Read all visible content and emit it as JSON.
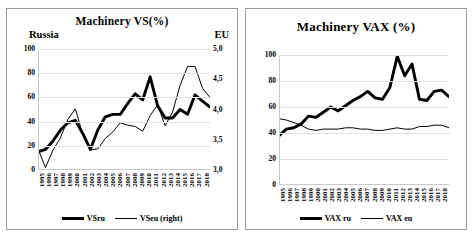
{
  "figure": {
    "panels": [
      {
        "id": "machinery-vs",
        "title": "Machinery VS(%)",
        "left_corner_label": "Russia",
        "right_corner_label": "EU"
      },
      {
        "id": "machinery-vax",
        "title": "Machinery VAX (%)"
      }
    ]
  },
  "chart_data": [
    {
      "type": "line",
      "id": "machinery-vs",
      "title": "Machinery VS(%)",
      "xlabel": "",
      "ylabel": "Russia",
      "y2label": "EU",
      "ylim": [
        0,
        100
      ],
      "yticks": [
        "0",
        "20",
        "40",
        "60",
        "80",
        "100"
      ],
      "ytick_values": [
        0,
        20,
        40,
        60,
        80,
        100
      ],
      "y2lim": [
        3.0,
        5.0
      ],
      "y2ticks": [
        "3,0",
        "3,5",
        "4,0",
        "4,5",
        "5,0"
      ],
      "y2tick_values": [
        3.0,
        3.5,
        4.0,
        4.5,
        5.0
      ],
      "grid": true,
      "legend_position": "bottom",
      "x": [
        "1995",
        "1996",
        "1997",
        "1998",
        "1999",
        "2000",
        "2001",
        "2002",
        "2003",
        "2004",
        "2005",
        "2006",
        "2007",
        "2008",
        "2009",
        "2010",
        "2011",
        "2012",
        "2013",
        "2014",
        "2015",
        "2016",
        "2017",
        "2018"
      ],
      "series": [
        {
          "name": "VSru",
          "axis": "left",
          "style": "bold",
          "values": [
            15,
            17,
            24,
            33,
            39,
            41,
            30,
            17,
            33,
            44,
            46,
            46,
            55,
            63,
            58,
            77,
            53,
            43,
            43,
            50,
            46,
            62,
            57,
            52
          ]
        },
        {
          "name": "VSeu (right)",
          "axis": "right",
          "style": "thin",
          "values": [
            3.35,
            3.04,
            3.33,
            3.53,
            3.84,
            4.01,
            3.58,
            3.33,
            3.35,
            3.52,
            3.63,
            3.78,
            3.74,
            3.72,
            3.64,
            3.9,
            4.08,
            3.73,
            3.96,
            4.4,
            4.71,
            4.71,
            4.35,
            4.2
          ]
        }
      ]
    },
    {
      "type": "line",
      "id": "machinery-vax",
      "title": "Machinery VAX (%)",
      "xlabel": "",
      "ylabel": "",
      "ylim": [
        0,
        100
      ],
      "yticks": [
        "0",
        "20",
        "40",
        "60",
        "80",
        "100"
      ],
      "ytick_values": [
        0,
        20,
        40,
        60,
        80,
        100
      ],
      "grid": true,
      "legend_position": "bottom",
      "x": [
        "1995",
        "1996",
        "1997",
        "1998",
        "1999",
        "2000",
        "2001",
        "2002",
        "2003",
        "2004",
        "2005",
        "2006",
        "2007",
        "2008",
        "2009",
        "2010",
        "2011",
        "2012",
        "2013",
        "2014",
        "2015",
        "2016",
        "2017",
        "2018"
      ],
      "series": [
        {
          "name": "VAX ru",
          "axis": "left",
          "style": "bold",
          "values": [
            38,
            43,
            44,
            47,
            53,
            52,
            56,
            60,
            57,
            61,
            65,
            68,
            72,
            67,
            66,
            75,
            99,
            84,
            93,
            66,
            65,
            72,
            73,
            68
          ]
        },
        {
          "name": "VAX eu",
          "axis": "left",
          "style": "thin",
          "values": [
            51,
            50,
            48,
            46,
            43,
            42,
            43,
            43,
            43,
            44,
            44,
            43,
            43,
            42,
            42,
            43,
            44,
            43,
            43,
            45,
            45,
            46,
            46,
            44
          ]
        }
      ]
    }
  ],
  "chart_data_tail": {
    "machinery-vs": {
      "vsru_last_points": [
        57,
        52
      ],
      "vseu_last_points": [
        4.35,
        4.2
      ]
    },
    "machinery-vax": {
      "vaxru_last_points": [
        73,
        68
      ],
      "vaxeu_last_points": [
        46,
        44
      ]
    }
  }
}
